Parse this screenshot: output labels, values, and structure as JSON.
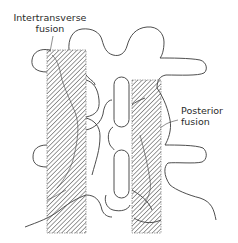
{
  "diagram": {
    "labels": {
      "intertransverse": {
        "line1": "Intertransverse",
        "line2": "fusion"
      },
      "posterior": {
        "line1": "Posterior",
        "line2": "fusion"
      }
    },
    "colors": {
      "outline": "#3a3a3a",
      "hatch": "#4a4a4a",
      "text": "#2a2a2a",
      "background": "#ffffff"
    }
  }
}
